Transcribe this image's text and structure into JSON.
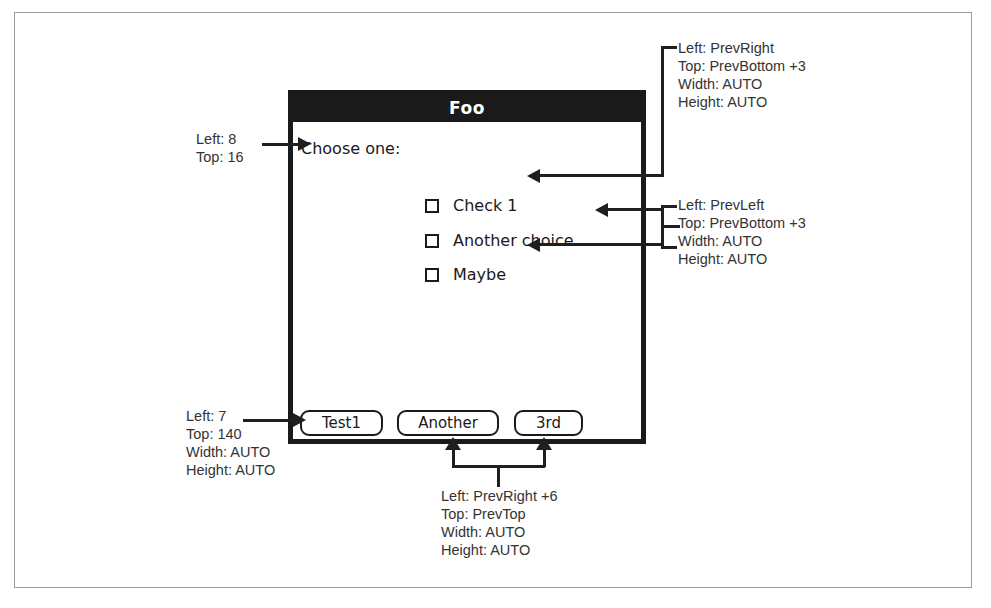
{
  "figure": {
    "colors": {
      "ink": "#1a1a1a",
      "titlebar_bg": "#1a1a1a",
      "titlebar_fg": "#ffffff",
      "leader_line": "#1f1f1f",
      "outer_frame": "#9a9a9a",
      "annotation_text": "#333333",
      "canvas": "#ffffff"
    }
  },
  "dialog": {
    "title": "Foo",
    "prompt_label": "Choose one:",
    "checkboxes": [
      {
        "label": "Check 1",
        "checked": false
      },
      {
        "label": "Another choice",
        "checked": false
      },
      {
        "label": "Maybe",
        "checked": false
      }
    ],
    "buttons": [
      {
        "label": "Test1"
      },
      {
        "label": "Another"
      },
      {
        "label": "3rd"
      }
    ]
  },
  "annotations": {
    "prompt_label": {
      "target": "Choose one: label",
      "lines": [
        "Left: 8",
        "Top: 16"
      ]
    },
    "first_checkbox": {
      "target": "Check 1 checkbox",
      "lines": [
        "Left: PrevRight",
        "Top: PrevBottom +3",
        "Width: AUTO",
        "Height: AUTO"
      ]
    },
    "following_checkboxes": {
      "target": "Another choice and Maybe checkboxes",
      "lines": [
        "Left: PrevLeft",
        "Top: PrevBottom +3",
        "Width: AUTO",
        "Height: AUTO"
      ]
    },
    "first_button": {
      "target": "Test1 button",
      "lines": [
        "Left: 7",
        "Top: 140",
        "Width: AUTO",
        "Height: AUTO"
      ]
    },
    "following_buttons": {
      "target": "Another and 3rd buttons",
      "lines": [
        "Left: PrevRight +6",
        "Top: PrevTop",
        "Width: AUTO",
        "Height: AUTO"
      ]
    }
  }
}
